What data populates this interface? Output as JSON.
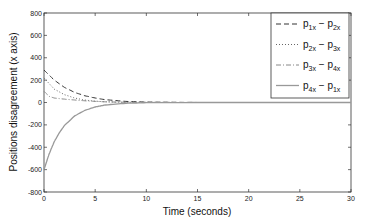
{
  "chart_data": {
    "type": "line",
    "title": "",
    "xlabel": "Time (seconds)",
    "ylabel": "Positions disagreement (x axis)",
    "xlim": [
      0,
      30
    ],
    "ylim": [
      -800,
      800
    ],
    "xticks": [
      "0",
      "5",
      "10",
      "15",
      "20",
      "25",
      "30"
    ],
    "yticks": [
      "800",
      "600",
      "400",
      "200",
      "0",
      "-200",
      "-400",
      "-600",
      "-800"
    ],
    "grid": false,
    "legend_position": "upper right",
    "series": [
      {
        "name": "p1x - p2x",
        "style": "dashed",
        "color": "#333333",
        "x": [
          0,
          1,
          2,
          3,
          4,
          5,
          6,
          8,
          10,
          15,
          30
        ],
        "y": [
          290,
          200,
          135,
          90,
          60,
          40,
          25,
          10,
          4,
          0,
          0
        ]
      },
      {
        "name": "p2x - p3x",
        "style": "dotted",
        "color": "#666666",
        "x": [
          0,
          1,
          2,
          3,
          4,
          5,
          6,
          8,
          10,
          15,
          30
        ],
        "y": [
          220,
          120,
          70,
          40,
          22,
          12,
          6,
          2,
          1,
          0,
          0
        ]
      },
      {
        "name": "p3x - p4x",
        "style": "dash-dot",
        "color": "#888888",
        "x": [
          0,
          0.5,
          1,
          2,
          3,
          4,
          5,
          6,
          8,
          10,
          15,
          30
        ],
        "y": [
          100,
          55,
          40,
          30,
          22,
          15,
          10,
          6,
          2,
          1,
          0,
          0
        ]
      },
      {
        "name": "p4x - p1x",
        "style": "solid",
        "color": "#999999",
        "x": [
          0,
          0.5,
          1,
          1.5,
          2,
          3,
          4,
          5,
          6,
          8,
          10,
          15,
          30
        ],
        "y": [
          -600,
          -460,
          -350,
          -270,
          -205,
          -120,
          -70,
          -40,
          -22,
          -7,
          -2,
          0,
          0
        ]
      }
    ]
  },
  "legend": [
    {
      "a": "p",
      "asub": "1x",
      "b": "p",
      "bsub": "2x"
    },
    {
      "a": "p",
      "asub": "2x",
      "b": "p",
      "bsub": "3x"
    },
    {
      "a": "p",
      "asub": "3x",
      "b": "p",
      "bsub": "4x"
    },
    {
      "a": "p",
      "asub": "4x",
      "b": "p",
      "bsub": "1x"
    }
  ]
}
